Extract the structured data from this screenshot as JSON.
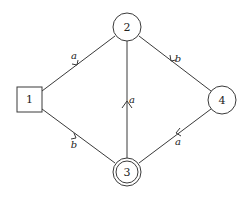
{
  "diagram": {
    "type": "finite-automaton",
    "nodes": [
      {
        "id": "1",
        "label": "1",
        "shape": "square",
        "role": "initial",
        "cx": 30,
        "cy": 100
      },
      {
        "id": "2",
        "label": "2",
        "shape": "circle",
        "role": "state",
        "cx": 127,
        "cy": 27
      },
      {
        "id": "3",
        "label": "3",
        "shape": "double-circle",
        "role": "accepting",
        "cx": 127,
        "cy": 172
      },
      {
        "id": "4",
        "label": "4",
        "shape": "circle",
        "role": "state",
        "cx": 222,
        "cy": 100
      }
    ],
    "edges": [
      {
        "from": "1",
        "to": "2",
        "label": "a"
      },
      {
        "from": "2",
        "to": "4",
        "label": "b"
      },
      {
        "from": "1",
        "to": "3",
        "label": "b"
      },
      {
        "from": "4",
        "to": "3",
        "label": "a"
      },
      {
        "from": "3",
        "to": "2",
        "label": "a"
      }
    ]
  }
}
